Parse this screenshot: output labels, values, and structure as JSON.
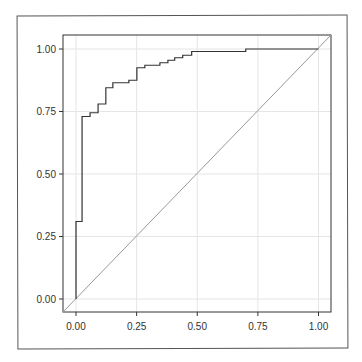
{
  "chart_data": {
    "type": "line",
    "title": "",
    "xlabel": "",
    "ylabel": "",
    "xlim": [
      -0.05,
      1.05
    ],
    "ylim": [
      -0.055,
      1.055
    ],
    "grid": true,
    "legend": null,
    "x_ticks": [
      "0.00",
      "0.25",
      "0.50",
      "0.75",
      "1.00"
    ],
    "y_ticks": [
      "0.00",
      "0.25",
      "0.50",
      "0.75",
      "1.00"
    ],
    "series": [
      {
        "name": "ROC curve",
        "style": "step",
        "color": "#333333",
        "points": [
          [
            0,
            0
          ],
          [
            0,
            0.31
          ],
          [
            0.025,
            0.31
          ],
          [
            0.025,
            0.73
          ],
          [
            0.058,
            0.73
          ],
          [
            0.058,
            0.745
          ],
          [
            0.091,
            0.745
          ],
          [
            0.091,
            0.78
          ],
          [
            0.123,
            0.78
          ],
          [
            0.123,
            0.845
          ],
          [
            0.152,
            0.845
          ],
          [
            0.152,
            0.865
          ],
          [
            0.218,
            0.865
          ],
          [
            0.218,
            0.875
          ],
          [
            0.251,
            0.875
          ],
          [
            0.251,
            0.925
          ],
          [
            0.284,
            0.925
          ],
          [
            0.284,
            0.935
          ],
          [
            0.346,
            0.935
          ],
          [
            0.346,
            0.945
          ],
          [
            0.379,
            0.945
          ],
          [
            0.379,
            0.955
          ],
          [
            0.407,
            0.955
          ],
          [
            0.407,
            0.965
          ],
          [
            0.44,
            0.965
          ],
          [
            0.44,
            0.975
          ],
          [
            0.477,
            0.975
          ],
          [
            0.477,
            0.99
          ],
          [
            0.7,
            0.99
          ],
          [
            0.7,
            1.0
          ],
          [
            1.0,
            1.0
          ]
        ]
      },
      {
        "name": "Reference diagonal",
        "style": "line",
        "color": "#999999",
        "points": [
          [
            -0.05,
            -0.05
          ],
          [
            1.05,
            1.05
          ]
        ]
      }
    ]
  },
  "colors": {
    "background": "#ffffff",
    "grid": "#e5e5e5",
    "axis": "#333333",
    "curve": "#333333",
    "diagonal": "#999999"
  }
}
